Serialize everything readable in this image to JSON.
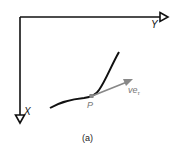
{
  "figure": {
    "caption": "(a)",
    "axes": {
      "horizontal_label": "Y",
      "vertical_label": "X",
      "color": "#111111"
    },
    "curve": {
      "color": "#111111"
    },
    "point": {
      "label": "P",
      "color": "#888888"
    },
    "velocity_vector": {
      "label_main": "ve",
      "label_subscript": "τ",
      "color": "#888888"
    }
  }
}
